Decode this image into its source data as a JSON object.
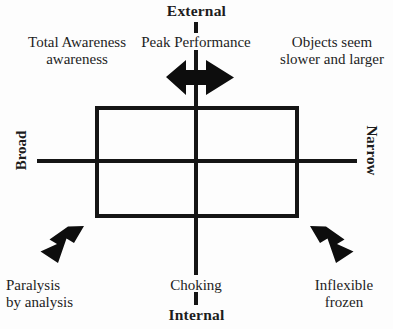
{
  "diagram": {
    "axes": {
      "vertical": {
        "top_label": "External",
        "bottom_label": "Internal"
      },
      "horizontal": {
        "left_label": "Broad",
        "right_label": "Narrow"
      }
    },
    "captions": {
      "top_left": "Total Awareness\nawareness",
      "top_center": "Peak Performance",
      "top_right": "Objects seem\nslower and larger",
      "bottom_left": "Paralysis\nby analysis",
      "bottom_center": "Choking",
      "bottom_right": "Inflexible\nfrozen"
    },
    "arrows": {
      "center_double_horizontal": "double-headed-horizontal-arrow",
      "lower_left": "arrow-down-left",
      "lower_right": "arrow-down-right"
    },
    "shapes": {
      "inner_rectangle": "optimal-zone-rectangle"
    },
    "colors": {
      "ink": "#1a1a1a",
      "background": "#fdfdfd"
    }
  }
}
